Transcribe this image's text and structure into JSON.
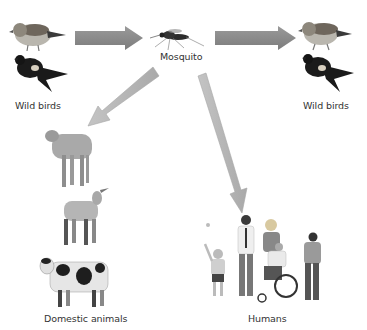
{
  "diagram": {
    "nodes": {
      "wild_birds_left": {
        "label": "Wild birds"
      },
      "mosquito": {
        "label": "Mosquito"
      },
      "wild_birds_right": {
        "label": "Wild birds"
      },
      "domestic_animals": {
        "label": "Domestic animals"
      },
      "humans": {
        "label": "Humans"
      }
    },
    "edges": [
      {
        "from": "Wild birds",
        "to": "Mosquito"
      },
      {
        "from": "Mosquito",
        "to": "Wild birds"
      },
      {
        "from": "Mosquito",
        "to": "Domestic animals"
      },
      {
        "from": "Mosquito",
        "to": "Humans"
      }
    ],
    "colors": {
      "horizontal_arrow": "#8a8a8a",
      "diagonal_arrow": "#b8b8b8",
      "text": "#333333"
    }
  }
}
